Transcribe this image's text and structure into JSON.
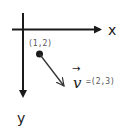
{
  "diagram": {
    "axes": {
      "x_label": "x",
      "y_label": "y",
      "color": "#1a1a1a"
    },
    "point": {
      "label": "(1,2)",
      "color": "#1a1a1a"
    },
    "vector": {
      "symbol": "v",
      "arrow_glyph": "→",
      "value": "=(2,3)",
      "color": "#333333"
    }
  }
}
